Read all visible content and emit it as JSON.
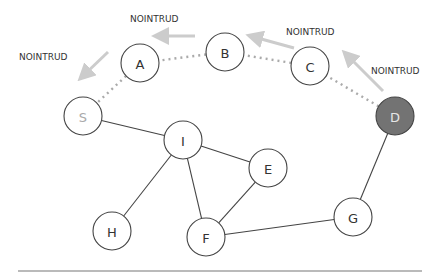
{
  "diagram": {
    "nodes": [
      {
        "id": "A",
        "label": "A",
        "x": 140,
        "y": 63,
        "fill": "#ffffff",
        "text": "#333333"
      },
      {
        "id": "B",
        "label": "B",
        "x": 225,
        "y": 52,
        "fill": "#ffffff",
        "text": "#333333"
      },
      {
        "id": "C",
        "label": "C",
        "x": 310,
        "y": 66,
        "fill": "#ffffff",
        "text": "#333333"
      },
      {
        "id": "D",
        "label": "D",
        "x": 395,
        "y": 116,
        "fill": "#737373",
        "text": "#e6e6e6"
      },
      {
        "id": "S",
        "label": "S",
        "x": 83,
        "y": 116,
        "fill": "#ffffff",
        "text": "#aaaaaa"
      },
      {
        "id": "I",
        "label": "I",
        "x": 183,
        "y": 140,
        "fill": "#ffffff",
        "text": "#333333"
      },
      {
        "id": "E",
        "label": "E",
        "x": 268,
        "y": 168,
        "fill": "#ffffff",
        "text": "#333333"
      },
      {
        "id": "H",
        "label": "H",
        "x": 112,
        "y": 231,
        "fill": "#ffffff",
        "text": "#333333"
      },
      {
        "id": "F",
        "label": "F",
        "x": 206,
        "y": 237,
        "fill": "#ffffff",
        "text": "#333333"
      },
      {
        "id": "G",
        "label": "G",
        "x": 353,
        "y": 217,
        "fill": "#ffffff",
        "text": "#333333"
      }
    ],
    "edges": [
      [
        "S",
        "I"
      ],
      [
        "I",
        "E"
      ],
      [
        "I",
        "H"
      ],
      [
        "I",
        "F"
      ],
      [
        "E",
        "F"
      ],
      [
        "F",
        "G"
      ],
      [
        "G",
        "D"
      ]
    ],
    "dotted_path": [
      [
        "D",
        "C"
      ],
      [
        "C",
        "B"
      ],
      [
        "B",
        "A"
      ],
      [
        "A",
        "S"
      ]
    ],
    "labels": [
      {
        "text": "NOINTRUD",
        "x": 130,
        "y": 22
      },
      {
        "text": "NOINTRUD",
        "x": 19,
        "y": 60
      },
      {
        "text": "NOINTRUD",
        "x": 286,
        "y": 35
      },
      {
        "text": "NOINTRUD",
        "x": 371,
        "y": 74
      }
    ],
    "arrows": [
      {
        "x1": 195,
        "y1": 36,
        "x2": 160,
        "y2": 36
      },
      {
        "x1": 108,
        "y1": 52,
        "x2": 84,
        "y2": 75
      },
      {
        "x1": 294,
        "y1": 48,
        "x2": 254,
        "y2": 37
      },
      {
        "x1": 383,
        "y1": 91,
        "x2": 348,
        "y2": 56
      }
    ],
    "colors": {
      "edge": "#444444",
      "dotted": "#aaaaaa",
      "arrow": "#cccccc",
      "node_stroke": "#444444",
      "baseline": "#777777"
    },
    "radius": 19
  }
}
